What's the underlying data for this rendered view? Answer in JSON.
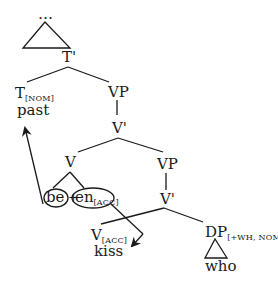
{
  "diagram": {
    "type": "syntax-tree",
    "nodes": {
      "top": {
        "label": "…"
      },
      "t_bar": {
        "label": "T'"
      },
      "t_head": {
        "label": "T",
        "feature": "[NOM]",
        "word": "past"
      },
      "vp_upper": {
        "label": "VP"
      },
      "v_bar_upper": {
        "label": "V'"
      },
      "v_head": {
        "label": "V"
      },
      "be": {
        "label": "be"
      },
      "plus": {
        "label": "+"
      },
      "en": {
        "label": "en",
        "feature": "[ACC]"
      },
      "vp_lower": {
        "label": "VP"
      },
      "v_bar_lower": {
        "label": "V'"
      },
      "v_lower": {
        "label": "V",
        "feature": "[ACC]",
        "word": "kiss"
      },
      "dp": {
        "label": "DP",
        "feature": "[+WH, NOM]",
        "word": "who"
      }
    },
    "arrows": [
      {
        "from": "be",
        "to": "t_head",
        "meaning": "be moves to T"
      },
      {
        "from": "en",
        "to": "v_lower",
        "meaning": "en feature links to V"
      }
    ],
    "colors": {
      "ink": "#1a1a1a",
      "background": "#ffffff"
    }
  }
}
